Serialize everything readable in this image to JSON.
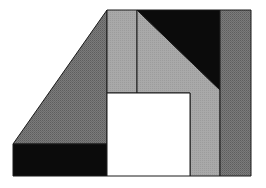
{
  "diagram": {
    "type": "dissection-puzzle",
    "width": 266,
    "height": 188,
    "colors": {
      "background": "#ffffff",
      "dark_gray": "#7b7b7b",
      "light_gray": "#a9a9a9",
      "black": "#0b0b0b",
      "white": "#ffffff",
      "outline": "#1a1a1a"
    },
    "pieces": [
      {
        "name": "left-trapezoid",
        "fill": "dark_gray",
        "points": "13,144 107,10 107,144"
      },
      {
        "name": "bottom-left-rect",
        "fill": "black",
        "points": "13,144 107,144 107,176 13,176"
      },
      {
        "name": "top-strip",
        "fill": "light_gray",
        "points": "107,10 137,10 137,93 107,93"
      },
      {
        "name": "diagonal-piece",
        "fill": "light_gray",
        "points": "137,10 220,90 220,176 190,176 190,93 137,93"
      },
      {
        "name": "top-right-triangle",
        "fill": "black",
        "points": "137,10 220,10 220,90"
      },
      {
        "name": "right-strip",
        "fill": "dark_gray",
        "points": "220,10 251,10 251,176 220,176"
      },
      {
        "name": "center-square",
        "fill": "white",
        "points": "107,93 190,93 190,176 107,176"
      }
    ]
  }
}
